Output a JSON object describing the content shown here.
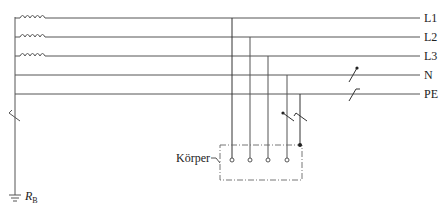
{
  "diagram": {
    "type": "electrical-network-schematic",
    "conductors": [
      {
        "id": "L1",
        "label": "L1",
        "y": 18,
        "has_coil": true,
        "drop_x": 232
      },
      {
        "id": "L2",
        "label": "L2",
        "y": 37,
        "has_coil": true,
        "drop_x": 250
      },
      {
        "id": "L3",
        "label": "L3",
        "y": 56,
        "has_coil": true,
        "drop_x": 268
      },
      {
        "id": "N",
        "label": "N",
        "y": 75,
        "has_coil": false,
        "drop_x": 287
      },
      {
        "id": "PE",
        "label": "PE",
        "y": 94,
        "has_coil": false,
        "drop_x": 300
      }
    ],
    "body_label": "Körper",
    "earth_resistance_label": "R",
    "earth_resistance_subscript": "B",
    "colors": {
      "line": "#555555",
      "text": "#222222",
      "background": "#ffffff"
    }
  }
}
